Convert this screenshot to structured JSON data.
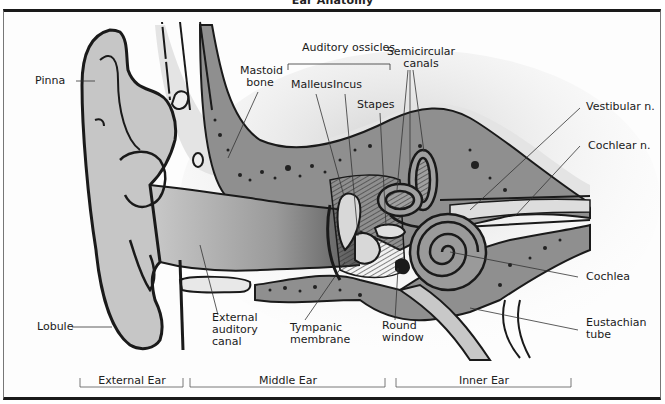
{
  "title": "Ear Anatomy",
  "labels": {
    "pinna": "Pinna",
    "mastoid_bone_1": "Mastoid",
    "mastoid_bone_2": "bone",
    "auditory_ossicles": "Auditory ossicles",
    "malleus": "Malleus",
    "incus": "Incus",
    "stapes": "Stapes",
    "semicircular_canals_1": "Semicircular",
    "semicircular_canals_2": "canals",
    "vestibular_n": "Vestibular n.",
    "cochlear_n": "Cochlear n.",
    "cochlea": "Cochlea",
    "eustachian_tube_1": "Eustachian",
    "eustachian_tube_2": "tube",
    "round_window_1": "Round",
    "round_window_2": "window",
    "tympanic_membrane_1": "Tympanic",
    "tympanic_membrane_2": "membrane",
    "external_auditory_canal_1": "External",
    "external_auditory_canal_2": "auditory",
    "external_auditory_canal_3": "canal",
    "lobule": "Lobule"
  },
  "sections": [
    {
      "label": "External Ear"
    },
    {
      "label": "Middle Ear"
    },
    {
      "label": "Inner Ear"
    }
  ],
  "colors": {
    "skin": "#c8c8c8",
    "bone": "#8e8e8e",
    "canal": "#a9a9a9",
    "outline": "#1a1a1a",
    "background": "#ffffff"
  }
}
